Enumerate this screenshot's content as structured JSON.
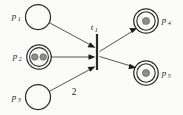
{
  "diagram": {
    "kind": "petri-net",
    "background_color": "#fbfbfa",
    "stroke_color": "#2a2a2a",
    "arc_color": "#555555",
    "token_color": "#8d8d8d",
    "places": [
      {
        "id": "p1",
        "label_base": "p",
        "label_sub": "1",
        "label_full": "p1",
        "cx": 38,
        "cy": 17,
        "r": 12.5,
        "double_ring": false,
        "tokens": 0,
        "label_side": "left",
        "label_x": 14,
        "label_y": 19
      },
      {
        "id": "p2",
        "label_base": "p",
        "label_sub": "2",
        "label_full": "p2",
        "cx": 39,
        "cy": 57,
        "r": 12.2,
        "double_ring": true,
        "inner_r": 9.4,
        "tokens": 2,
        "label_side": "left",
        "label_x": 15,
        "label_y": 59
      },
      {
        "id": "p3",
        "label_base": "p",
        "label_sub": "3",
        "label_full": "p3",
        "cx": 38,
        "cy": 97,
        "r": 12.5,
        "double_ring": false,
        "tokens": 0,
        "label_side": "left",
        "label_x": 14,
        "label_y": 100
      },
      {
        "id": "p4",
        "label_base": "p",
        "label_sub": "4",
        "label_full": "p4",
        "cx": 146,
        "cy": 21,
        "r": 12.2,
        "double_ring": true,
        "inner_r": 9.2,
        "tokens": 1,
        "label_side": "right",
        "label_x": 162,
        "label_y": 23
      },
      {
        "id": "p5",
        "label_base": "p",
        "label_sub": "5",
        "label_full": "p5",
        "cx": 146,
        "cy": 73,
        "r": 12.2,
        "inner_r": 9.2,
        "double_ring": true,
        "tokens": 1,
        "label_side": "right",
        "label_x": 162,
        "label_y": 76
      }
    ],
    "transitions": [
      {
        "id": "t1",
        "label_base": "t",
        "label_sub": "1",
        "label_full": "t1",
        "x": 97,
        "y_top": 34,
        "y_bottom": 70,
        "label_x": 92,
        "label_y": 30
      }
    ],
    "arcs": [
      {
        "id": "arc-p1-t1",
        "from": "p1",
        "to": "t1",
        "weight": null,
        "direction": "place-to-transition"
      },
      {
        "id": "arc-p2-t1",
        "from": "p2",
        "to": "t1",
        "weight": null,
        "direction": "place-to-transition"
      },
      {
        "id": "arc-p3-t1",
        "from": "p3",
        "to": "t1",
        "weight": "2",
        "weight_x": 74,
        "weight_y": 95,
        "direction": "place-to-transition"
      },
      {
        "id": "arc-t1-p4",
        "from": "t1",
        "to": "p4",
        "weight": null,
        "direction": "transition-to-place"
      },
      {
        "id": "arc-t1-p5",
        "from": "t1",
        "to": "p5",
        "weight": null,
        "direction": "transition-to-place"
      }
    ],
    "arc_weight_labels": [
      {
        "id": "weight-2",
        "text": "2"
      }
    ]
  }
}
